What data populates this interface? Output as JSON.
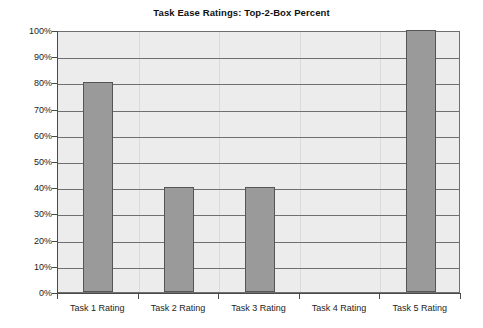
{
  "chart_data": {
    "type": "bar",
    "title": "Task Ease Ratings: Top-2-Box Percent",
    "xlabel": "",
    "ylabel": "",
    "categories": [
      "Task 1 Rating",
      "Task 2 Rating",
      "Task 3 Rating",
      "Task 4 Rating",
      "Task 5 Rating"
    ],
    "values": [
      80,
      40,
      40,
      0,
      100
    ],
    "value_labels": [
      "80%",
      "40%",
      "40%",
      "0%",
      "100%"
    ],
    "ylim": [
      0,
      100
    ],
    "ytick_values": [
      0,
      10,
      20,
      30,
      40,
      50,
      60,
      70,
      80,
      90,
      100
    ],
    "ytick_labels": [
      "0%",
      "10%",
      "20%",
      "30%",
      "40%",
      "50%",
      "60%",
      "70%",
      "80%",
      "90%",
      "100%"
    ],
    "grid": true,
    "grid_axis": "y",
    "legend": false,
    "legend_position": "none",
    "series": [
      {
        "name": "Top-2-Box Percent",
        "values": [
          80,
          40,
          40,
          0,
          100
        ]
      }
    ]
  },
  "colors": {
    "bar_fill": "#9a9a9a",
    "bar_border": "#555555",
    "plot_background": "#ececec",
    "gridline": "#6f6f6f",
    "axis": "#4a4a4a",
    "page_background": "#ffffff",
    "text": "#1d1d1d"
  }
}
